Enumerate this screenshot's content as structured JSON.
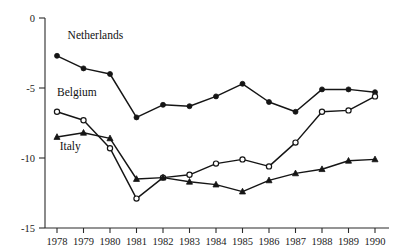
{
  "chart_data": {
    "type": "line",
    "title": "",
    "subtitle": "",
    "xlabel": "",
    "ylabel": "",
    "grid": false,
    "legend_position": "inline-labels",
    "categories": [
      "1978",
      "1979",
      "1980",
      "1981",
      "1982",
      "1983",
      "1984",
      "1985",
      "1986",
      "1987",
      "1988",
      "1989",
      "1990"
    ],
    "x": [
      1978,
      1979,
      1980,
      1981,
      1982,
      1983,
      1984,
      1985,
      1986,
      1987,
      1988,
      1989,
      1990
    ],
    "xlim": [
      1977.6,
      1990.4
    ],
    "ylim": [
      -15,
      0
    ],
    "ytick_labels": [
      "0",
      "-5",
      "-10",
      "-15"
    ],
    "yticks": [
      0,
      -5,
      -10,
      -15
    ],
    "xtick_labels": [
      "1978",
      "1979",
      "1980",
      "1981",
      "1982",
      "1983",
      "1984",
      "1985",
      "1986",
      "1987",
      "1988",
      "1989",
      "1990"
    ],
    "series": [
      {
        "name": "Netherlands",
        "marker": "filled-circle",
        "label_text": "Netherlands",
        "values": [
          -2.7,
          -3.6,
          -4.0,
          -7.1,
          -6.2,
          -6.3,
          -5.6,
          -4.7,
          -6.0,
          -6.7,
          -5.1,
          -5.1,
          -5.3
        ]
      },
      {
        "name": "Belgium",
        "marker": "open-circle",
        "label_text": "Belgium",
        "values": [
          -6.7,
          -7.3,
          -9.3,
          -12.9,
          -11.4,
          -11.2,
          -10.4,
          -10.1,
          -10.6,
          -8.9,
          -6.7,
          -6.6,
          -5.6
        ]
      },
      {
        "name": "Italy",
        "marker": "filled-triangle",
        "label_text": "Italy",
        "values": [
          -8.5,
          -8.2,
          -8.6,
          -11.5,
          -11.4,
          -11.7,
          -11.9,
          -12.4,
          -11.6,
          -11.1,
          -10.8,
          -10.2,
          -10.1
        ]
      }
    ],
    "annotations": [
      {
        "text": "Netherlands",
        "x": 1978.4,
        "y": -1.5
      },
      {
        "text": "Belgium",
        "x": 1978.0,
        "y": -5.6
      },
      {
        "text": "Italy",
        "x": 1978.1,
        "y": -9.4
      }
    ],
    "colors": {
      "axis": "#2b2b2b",
      "line": "#151515",
      "text": "#1a1a1a",
      "background": "#ffffff"
    }
  }
}
